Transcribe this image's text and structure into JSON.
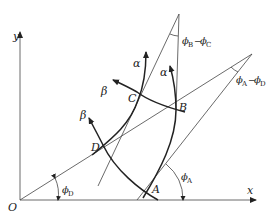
{
  "diagram": {
    "axes": {
      "x_label": "x",
      "y_label": "y",
      "origin_label": "O"
    },
    "points": {
      "A": "A",
      "B": "B",
      "C": "C",
      "D": "D"
    },
    "curve_labels": {
      "alpha_left": "α",
      "alpha_right": "α",
      "beta_upper": "β",
      "beta_lower": "β"
    },
    "angles": {
      "phi_D": {
        "symbol": "ϕ",
        "sub": "D"
      },
      "phi_A": {
        "symbol": "ϕ",
        "sub": "A"
      },
      "phi_B_minus_C": {
        "symbol1": "ϕ",
        "sub1": "B",
        "minus": "−",
        "symbol2": "ϕ",
        "sub2": "C"
      },
      "phi_A_minus_D": {
        "symbol1": "ϕ",
        "sub1": "A",
        "minus": "−",
        "symbol2": "ϕ",
        "sub2": "D"
      }
    },
    "colors": {
      "line": "#444444",
      "curve": "#222222",
      "background": "#ffffff"
    }
  }
}
